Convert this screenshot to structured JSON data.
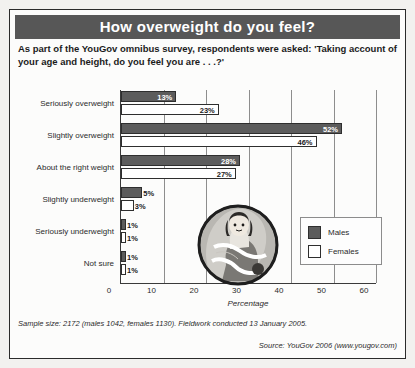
{
  "header": {
    "title": "How overweight do you feel?",
    "title_bg": "#575757"
  },
  "subtitle": "As part of the YouGov omnibus survey, respondents were asked: 'Taking account of your age and height, do you feel you are . . .?'",
  "legend": {
    "males_label": "Males",
    "females_label": "Females",
    "males_color": "#5c5c5c",
    "females_color": "#ffffff"
  },
  "illustration": {
    "name": "woman-with-tape-measure-illustration"
  },
  "footer": {
    "sample_note": "Sample size: 2172 (males 1042, females 1130). Fieldwork conducted 13 January 2005.",
    "source": "Source: YouGov 2006 (www.yougov.com)"
  },
  "chart_data": {
    "type": "bar",
    "orientation": "horizontal",
    "title": "How overweight do you feel?",
    "xlabel": "Percentage",
    "ylabel": "",
    "xlim": [
      0,
      60
    ],
    "xticks": [
      0,
      10,
      20,
      30,
      40,
      50,
      60
    ],
    "xtick_labels": [
      "0",
      "10",
      "20",
      "30",
      "40",
      "50",
      "60"
    ],
    "grid": true,
    "legend_position": "right-inside",
    "categories": [
      "Seriously overweight",
      "Slightly overweight",
      "About the right weight",
      "Slightly underweight",
      "Seriously underweight",
      "Not sure"
    ],
    "series": [
      {
        "name": "Males",
        "color": "#5c5c5c",
        "values": [
          13,
          52,
          28,
          5,
          1,
          1
        ],
        "value_labels": [
          "13%",
          "52%",
          "28%",
          "5%",
          "1%",
          "1%"
        ]
      },
      {
        "name": "Females",
        "color": "#ffffff",
        "values": [
          23,
          46,
          27,
          3,
          1,
          1
        ],
        "value_labels": [
          "23%",
          "46%",
          "27%",
          "3%",
          "1%",
          "1%"
        ]
      }
    ]
  }
}
